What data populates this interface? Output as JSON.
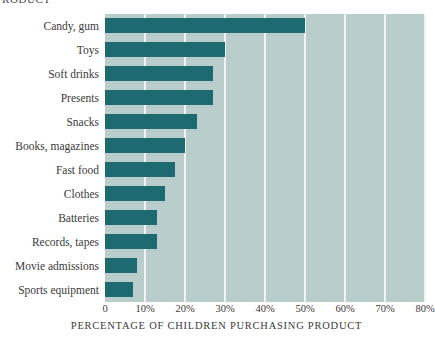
{
  "clipped_header": "RODUCT",
  "chart_data": {
    "type": "bar",
    "orientation": "horizontal",
    "title": "",
    "xlabel": "PERCENTAGE OF CHILDREN PURCHASING PRODUCT",
    "ylabel": "",
    "xlim": [
      0,
      80
    ],
    "grid": true,
    "legend": false,
    "categories": [
      "Candy, gum",
      "Toys",
      "Soft drinks",
      "Presents",
      "Snacks",
      "Books, magazines",
      "Fast food",
      "Clothes",
      "Batteries",
      "Records, tapes",
      "Movie admissions",
      "Sports equipment"
    ],
    "values": [
      50,
      30,
      27,
      27,
      23,
      20,
      17.5,
      15,
      13,
      13,
      8,
      7
    ],
    "xticks": [
      0,
      10,
      20,
      30,
      40,
      50,
      60,
      70,
      80
    ],
    "xticklabels": [
      "0",
      "10%",
      "20%",
      "30%",
      "40%",
      "50%",
      "60%",
      "70%",
      "80%"
    ],
    "colors": {
      "bar": "#1d6b70",
      "plot_background": "#b9cdcd",
      "gridline": "#eef4f4",
      "text": "#3a3a3a",
      "page_background": "#ffffff"
    }
  }
}
